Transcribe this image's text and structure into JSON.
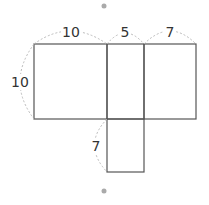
{
  "diagram": {
    "type": "net-of-rectangular-prism",
    "colors": {
      "line": "#555555",
      "dashed": "#bbbbbb",
      "dot": "#aaaaaa",
      "text": "#333333"
    },
    "labels": {
      "top_left": "10",
      "top_middle": "5",
      "top_right": "7",
      "left_side": "10",
      "bottom_tab": "7"
    }
  }
}
